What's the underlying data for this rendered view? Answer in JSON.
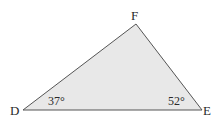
{
  "diagram": {
    "type": "triangle",
    "fill_color": "#e8e8e8",
    "stroke_color": "#555555",
    "vertices": [
      {
        "name": "D",
        "x": 23,
        "y": 110
      },
      {
        "name": "E",
        "x": 202,
        "y": 110
      },
      {
        "name": "F",
        "x": 136,
        "y": 24
      }
    ],
    "labels": {
      "D": "D",
      "E": "E",
      "F": "F"
    },
    "angles": {
      "D": "37°",
      "E": "52°"
    }
  }
}
